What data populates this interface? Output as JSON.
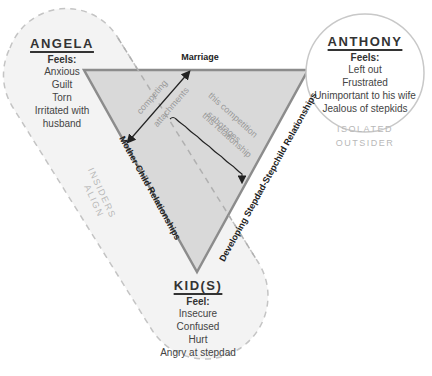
{
  "angela": {
    "name": "ANGELA",
    "feels_heading": "Feels:",
    "feelings": [
      "Anxious",
      "Guilt",
      "Torn",
      "Irritated with",
      "husband"
    ]
  },
  "anthony": {
    "name": "ANTHONY",
    "feels_heading": "Feels:",
    "feelings": [
      "Left out",
      "Frustrated",
      "Unimportant to his wife",
      "Jealous of stepkids"
    ],
    "tag_line1": "ISOLATED",
    "tag_line2": "OUTSIDER"
  },
  "kids": {
    "name": "KID(S)",
    "feels_heading": "Feel:",
    "feelings": [
      "Insecure",
      "Confused",
      "Hurt",
      "Angry at stepdad"
    ]
  },
  "edges": {
    "top": "Marriage",
    "left": "Mother-Child Relationships",
    "right": "Developing Stepdad-Stepchild Relationships"
  },
  "annotations": {
    "competing_line1": "competing",
    "competing_line2": "attachments",
    "sabotage_line1": "this competition",
    "sabotage_line2": "sabotages",
    "sabotage_line3": "this relationship",
    "insiders_line1": "INSIDERS",
    "insiders_line2": "ALIGN"
  },
  "colors": {
    "triangle_fill": "#d9d9d9",
    "triangle_stroke": "#8c8c8c",
    "capsule_fill": "#f3f3f3",
    "capsule_stroke": "#c4c4c4",
    "tag_text": "#b8b8b8"
  }
}
